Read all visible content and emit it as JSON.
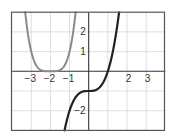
{
  "chart_data": {
    "type": "line",
    "title": "",
    "xlabel": "",
    "ylabel": "",
    "xlim": [
      -4,
      4
    ],
    "ylim": [
      -3,
      3
    ],
    "grid": true,
    "x_ticks": [
      -3,
      -2,
      -1,
      2,
      3
    ],
    "x_tick_labels": [
      "−3",
      "−2",
      "−1",
      "2",
      "3"
    ],
    "y_ticks": [
      2,
      1,
      -2
    ],
    "y_tick_labels": [
      "2",
      "1",
      "−2"
    ],
    "series": [
      {
        "name": "y = (x+2)^4",
        "color": "#8a8a8a",
        "x": [
          -3.32,
          -3.2,
          -3.0,
          -2.8,
          -2.6,
          -2.4,
          -2.2,
          -2.0,
          -1.8,
          -1.6,
          -1.4,
          -1.2,
          -1.0,
          -0.8,
          -0.68
        ],
        "y": [
          3.0,
          2.07,
          1.0,
          0.41,
          0.13,
          0.03,
          0.0,
          0.0,
          0.0,
          0.03,
          0.13,
          0.41,
          1.0,
          2.07,
          3.0
        ]
      },
      {
        "name": "y = x^3 - 1",
        "color": "#222222",
        "x": [
          -1.26,
          -1.1,
          -0.9,
          -0.7,
          -0.5,
          -0.3,
          -0.1,
          0.0,
          0.1,
          0.3,
          0.5,
          0.7,
          0.9,
          1.0,
          1.1,
          1.3,
          1.5,
          1.587
        ],
        "y": [
          -3.0,
          -2.33,
          -1.73,
          -1.34,
          -1.13,
          -1.03,
          -1.0,
          -1.0,
          -1.0,
          -0.97,
          -0.88,
          -0.66,
          -0.27,
          0.0,
          0.33,
          1.2,
          2.38,
          3.0
        ]
      }
    ]
  },
  "colors": {
    "grid": "#d6d6d6",
    "frame": "#555555",
    "axis": "#333333"
  }
}
